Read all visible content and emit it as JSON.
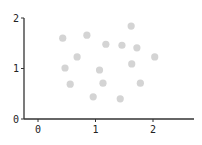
{
  "chart_data": {
    "type": "scatter",
    "title": "",
    "xlabel": "",
    "ylabel": "",
    "xlim": [
      -0.25,
      2.7
    ],
    "ylim": [
      0,
      2
    ],
    "x_ticks": [
      0,
      1,
      2
    ],
    "y_ticks": [
      0,
      1,
      2
    ],
    "x_tick_labels": [
      "0",
      "1",
      "2"
    ],
    "y_tick_labels": [
      "0",
      "1",
      "2"
    ],
    "grid": false,
    "legend": null,
    "series": [
      {
        "name": "points",
        "color": "#d4d4d4",
        "points": [
          {
            "x": 0.43,
            "y": 1.6
          },
          {
            "x": 0.85,
            "y": 1.66
          },
          {
            "x": 1.62,
            "y": 1.84
          },
          {
            "x": 1.18,
            "y": 1.48
          },
          {
            "x": 1.46,
            "y": 1.46
          },
          {
            "x": 1.72,
            "y": 1.41
          },
          {
            "x": 0.68,
            "y": 1.23
          },
          {
            "x": 2.03,
            "y": 1.23
          },
          {
            "x": 0.47,
            "y": 1.01
          },
          {
            "x": 1.07,
            "y": 0.97
          },
          {
            "x": 1.63,
            "y": 1.09
          },
          {
            "x": 0.56,
            "y": 0.69
          },
          {
            "x": 1.13,
            "y": 0.71
          },
          {
            "x": 1.78,
            "y": 0.71
          },
          {
            "x": 0.96,
            "y": 0.44
          },
          {
            "x": 1.43,
            "y": 0.4
          }
        ]
      }
    ]
  },
  "colors": {
    "axis": "#333333",
    "point": "#d4d4d4",
    "background": "#ffffff"
  }
}
